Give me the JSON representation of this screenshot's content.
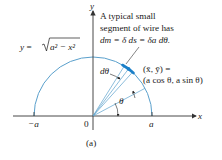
{
  "figure": {
    "label": "(a)",
    "curve_equation": {
      "lhs": "y = ",
      "radical": "a² − x²"
    },
    "annotation": {
      "line1": "A typical small",
      "line2": "segment of wire has",
      "line3": "dm = δ ds = δa dθ."
    },
    "centroid_label": {
      "line1": "(x̄, ȳ) =",
      "line2": "(a cos θ, a sin θ)"
    },
    "angle_labels": {
      "dtheta": "dθ",
      "theta": "θ"
    },
    "axes": {
      "x_label": "x",
      "y_label": "y",
      "ticks": {
        "neg_a": "−a",
        "origin": "0",
        "pos_a": "a"
      }
    },
    "colors": {
      "arc": "#5aa0cc",
      "segment": "#1a7fc8",
      "axis": "#333333",
      "text": "#1a1a1a"
    }
  }
}
